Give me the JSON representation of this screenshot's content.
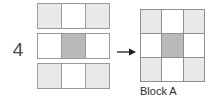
{
  "question": {
    "number": "4"
  },
  "colors": {
    "shaded_light": "#e9e9e9",
    "shaded_dark": "#b9b9b9",
    "empty": "#ffffff",
    "border": "#9a9a9a",
    "text": "#2b2b2b"
  },
  "left_strips": [
    {
      "name": "top-strip",
      "cells": [
        "light",
        "white",
        "light"
      ]
    },
    {
      "name": "middle-strip",
      "cells": [
        "white",
        "dark",
        "white"
      ]
    },
    {
      "name": "bottom-strip",
      "cells": [
        "light",
        "white",
        "light"
      ]
    }
  ],
  "arrow": {
    "icon": "arrow-right-icon",
    "direction": "right"
  },
  "block": {
    "caption": "Block A",
    "rows": [
      [
        "light",
        "white",
        "light"
      ],
      [
        "white",
        "dark",
        "white"
      ],
      [
        "light",
        "white",
        "light"
      ]
    ]
  }
}
